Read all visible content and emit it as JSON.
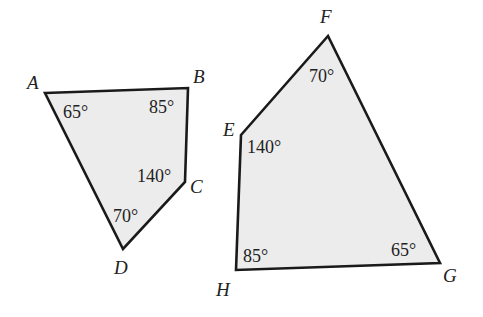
{
  "diagram": {
    "type": "similar-quadrilaterals",
    "colors": {
      "fill": "#ececec",
      "stroke": "#1a1a1a",
      "text": "#222222",
      "background": "#ffffff"
    },
    "shapes": [
      {
        "name": "ABCD",
        "vertices": [
          {
            "label": "A",
            "x": 45,
            "y": 93,
            "angle": "65°"
          },
          {
            "label": "B",
            "x": 188,
            "y": 88,
            "angle": "85°"
          },
          {
            "label": "C",
            "x": 185,
            "y": 182,
            "angle": "140°"
          },
          {
            "label": "D",
            "x": 123,
            "y": 249,
            "angle": "70°"
          }
        ]
      },
      {
        "name": "EFGH",
        "vertices": [
          {
            "label": "E",
            "x": 241,
            "y": 135,
            "angle": "140°"
          },
          {
            "label": "F",
            "x": 328,
            "y": 36,
            "angle": "70°"
          },
          {
            "label": "G",
            "x": 440,
            "y": 263,
            "angle": "65°"
          },
          {
            "label": "H",
            "x": 236,
            "y": 270,
            "angle": "85°"
          }
        ]
      }
    ]
  },
  "labels": {
    "A": "A",
    "B": "B",
    "C": "C",
    "D": "D",
    "E": "E",
    "F": "F",
    "G": "G",
    "H": "H",
    "angle_A": "65°",
    "angle_B": "85°",
    "angle_C": "140°",
    "angle_D": "70°",
    "angle_E": "140°",
    "angle_F": "70°",
    "angle_G": "65°",
    "angle_H": "85°"
  }
}
